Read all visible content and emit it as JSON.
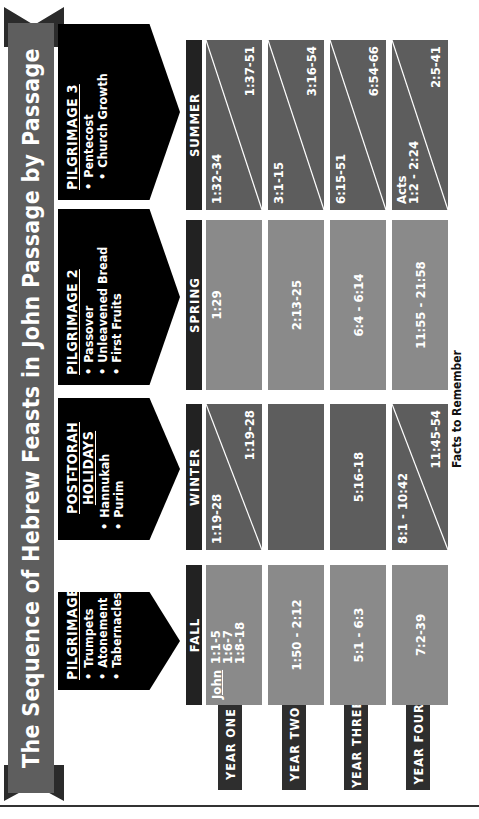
{
  "title": "The Sequence of Hebrew Feasts in John Passage by Passage",
  "feasts": [
    {
      "heading": "PILGRIMAGE 1",
      "items": [
        "Trumpets",
        "Atonement",
        "Tabernacles"
      ]
    },
    {
      "heading_line1": "POST-TORAH",
      "heading_line2": "HOLIDAYS",
      "items": [
        "Hannukah",
        "Purim"
      ]
    },
    {
      "heading": "PILGRIMAGE 2",
      "items": [
        "Passover",
        "Unleavened Bread",
        "First Fruits"
      ]
    },
    {
      "heading": "PILGRIMAGE 3",
      "items": [
        "Pentecost",
        "Church Growth"
      ]
    }
  ],
  "seasons": [
    "FALL",
    "WINTER",
    "SPRING",
    "SUMMER"
  ],
  "years": [
    "YEAR ONE",
    "YEAR TWO",
    "YEAR THREE",
    "YEAR FOUR"
  ],
  "grid": {
    "year_one": {
      "fall": {
        "book": "John",
        "refs": [
          "1:1-5",
          "1:6-7",
          "1:8-18"
        ]
      },
      "winter": {
        "upper": "1:19-28",
        "lower": "1:19-28"
      },
      "spring": {
        "text": "1:29"
      },
      "summer": {
        "upper": "1:32-34",
        "lower": "1:37-51"
      }
    },
    "year_two": {
      "fall": {
        "text": "1:50 - 2:12"
      },
      "winter": {
        "text": ""
      },
      "spring": {
        "text": "2:13-25"
      },
      "summer": {
        "upper": "3:1-15",
        "lower": "3:16-54"
      }
    },
    "year_three": {
      "fall": {
        "text": "5:1 - 6:3"
      },
      "winter": {
        "text": "5:16-18"
      },
      "spring": {
        "text": "6:4 - 6:14"
      },
      "summer": {
        "upper": "6:15-51",
        "lower": "6:54-66"
      }
    },
    "year_four": {
      "fall": {
        "text": "7:2-39"
      },
      "winter": {
        "upper": "8:1 - 10:42",
        "lower": "11:45-54"
      },
      "spring": {
        "text": "11:55 - 21:58"
      },
      "summer": {
        "upper_line1": "Acts",
        "upper_line2": "1:2 - 2:24",
        "lower": "2:5-41"
      }
    }
  },
  "footer": "Facts to Remember",
  "colors": {
    "banner": "#5e5e5e",
    "arrow": "#000000",
    "season_header": "#222222",
    "year_label": "#2e2e2e",
    "cell_light": "#8a8a8a",
    "cell_dark": "#5d5d5d"
  }
}
